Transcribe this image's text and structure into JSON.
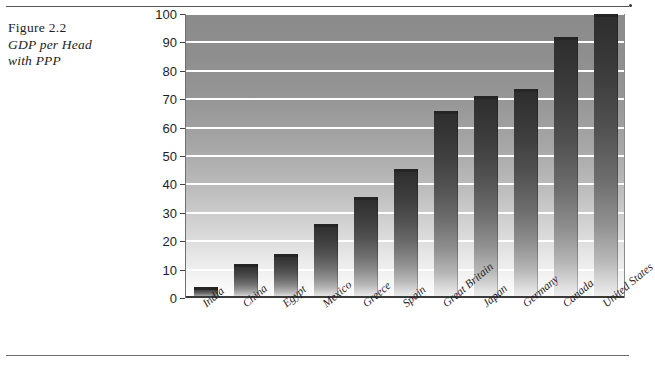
{
  "figure": {
    "caption_line1": "Figure 2.2",
    "caption_line2": "GDP per Head",
    "caption_line3": "with PPP"
  },
  "chart_data": {
    "type": "bar",
    "title": "GDP per Head with PPP",
    "xlabel": "",
    "ylabel": "",
    "ylim": [
      0,
      100
    ],
    "yticks": [
      0,
      10,
      20,
      30,
      40,
      50,
      60,
      70,
      80,
      90,
      100
    ],
    "grid": true,
    "legend": "none",
    "categories": [
      "India",
      "China",
      "Egypt",
      "Mexico",
      "Greece",
      "Spain",
      "Great Britain",
      "Japan",
      "Germany",
      "Canada",
      "United States"
    ],
    "values": [
      4,
      12,
      15.5,
      26,
      35.5,
      45.5,
      66,
      71,
      73.5,
      92,
      100
    ],
    "bar_color": "#3f3f3f",
    "plot_background": "gradient-gray-dark-to-light",
    "gridline_color": "#ffffff"
  }
}
